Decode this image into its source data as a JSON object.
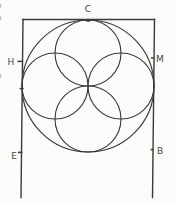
{
  "figure": {
    "ink": "#3a3a38",
    "label_color": "#474745",
    "background": "#fbfbf9",
    "rect_edges": {
      "top": {
        "x1": 23,
        "y1": 19.5,
        "x2": 154.5,
        "y2": 19.5
      },
      "left": {
        "x1": 23,
        "y1": 19.5,
        "x2": 21,
        "y2": 197.5
      },
      "right": {
        "x1": 154.5,
        "y1": 19.5,
        "x2": 152.5,
        "y2": 197.5
      }
    },
    "circles": [
      {
        "name": "outer-circle",
        "cx": 88,
        "cy": 86,
        "r": 66
      },
      {
        "name": "top-circle",
        "cx": 88,
        "cy": 53,
        "r": 33
      },
      {
        "name": "bottom-circle",
        "cx": 88,
        "cy": 119,
        "r": 33
      },
      {
        "name": "left-circle",
        "cx": 55,
        "cy": 86,
        "r": 33
      },
      {
        "name": "right-circle",
        "cx": 121,
        "cy": 86,
        "r": 33
      }
    ],
    "ticks": [
      {
        "name": "point-c-tick",
        "x1": 86.9,
        "y1": 20.8,
        "x2": 89.3,
        "y2": 20.8
      },
      {
        "name": "point-h-tick",
        "x1": 17.5,
        "y1": 61.4,
        "x2": 22.6,
        "y2": 61.4
      },
      {
        "name": "point-m-tick",
        "x1": 151,
        "y1": 58,
        "x2": 154.6,
        "y2": 58
      },
      {
        "name": "left-tangent-tick",
        "x1": 19.6,
        "y1": 88.6,
        "x2": 23.6,
        "y2": 88.6
      },
      {
        "name": "point-e-tick",
        "x1": 18,
        "y1": 152.4,
        "x2": 22.4,
        "y2": 152.4
      },
      {
        "name": "point-b-tick",
        "x1": 150.6,
        "y1": 149.6,
        "x2": 153.8,
        "y2": 149.6
      }
    ],
    "artifacts": [
      {
        "x1": 0.6,
        "y1": 4,
        "x2": 0.6,
        "y2": 7.5
      },
      {
        "x1": 0.6,
        "y1": 16.5,
        "x2": 0.6,
        "y2": 20
      },
      {
        "x1": 0.6,
        "y1": 74.5,
        "x2": 0.6,
        "y2": 78
      }
    ],
    "labels": [
      {
        "text": "C",
        "x": 88,
        "y": 11.5
      },
      {
        "text": "H",
        "x": 11,
        "y": 64.5
      },
      {
        "text": "M",
        "x": 160,
        "y": 61.5
      },
      {
        "text": "E",
        "x": 14,
        "y": 158.5
      },
      {
        "text": "B",
        "x": 160,
        "y": 154
      }
    ]
  }
}
